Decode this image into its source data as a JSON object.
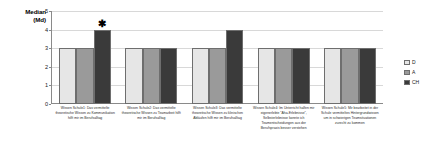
{
  "chart_data": {
    "type": "bar",
    "title": "",
    "subtitle": "",
    "xlabel": "",
    "ylabel": "Median\n(Md)",
    "ylabel_lines": [
      "Median",
      "(Md)"
    ],
    "ylim": [
      0,
      5
    ],
    "yticks": [
      0,
      1,
      2,
      3,
      4,
      5
    ],
    "ytick_labels": [
      "0",
      "1",
      "2",
      "3",
      "4",
      "5"
    ],
    "grid": true,
    "grid_axis": "y",
    "legend_position": "right",
    "categories": [
      "Wissen Schule1: Das vermittelte theoretische Wissen zu Kommunikation hilft mir im Berufsalltag",
      "Wissen Schule2: Das vermittelte theoretische Wissen zu Teamarbeit hilft mir im Berufsalltag",
      "Wissen Schule3: Das vermittelte theoretische Wissen zu klinischen Abläufen hilft mir im Berufsalltag",
      "Wissen Schule4: Im Unterricht halfen mir eigenerlebte \"Aha-Erlebnisse\", Selbsterlebnisse konnte ich Teamentscheidungen aus der Berufspraxis besser verstehen",
      "Wissen Schule5: Mir bearbeitet in der Schule vermitteltes Hintergrundwissen um in schwierigen Teamsituationen zurecht zu kommen"
    ],
    "series": [
      {
        "name": "D",
        "color": "#e6e6e6",
        "values": [
          3,
          3,
          3,
          3,
          3
        ]
      },
      {
        "name": "A",
        "color": "#9a9a9a",
        "values": [
          3,
          3,
          3,
          3,
          3
        ]
      },
      {
        "name": "CH",
        "color": "#3a3a3a",
        "values": [
          4,
          3,
          4,
          3,
          3
        ]
      }
    ],
    "annotations": [
      {
        "text": "✱",
        "category_index": 0,
        "series_index": 2,
        "value": 4,
        "meaning": "significance-marker"
      }
    ]
  },
  "legend": {
    "entries": [
      {
        "label": "D",
        "color": "#e6e6e6"
      },
      {
        "label": "A",
        "color": "#9a9a9a"
      },
      {
        "label": "CH",
        "color": "#3a3a3a"
      }
    ]
  },
  "colors": {
    "background": "#ffffff",
    "axis": "#8a8a8a",
    "grid": "#d8d8d8",
    "text": "#1a1a1a",
    "series_d": "#e6e6e6",
    "series_a": "#9a9a9a",
    "series_ch": "#3a3a3a"
  }
}
